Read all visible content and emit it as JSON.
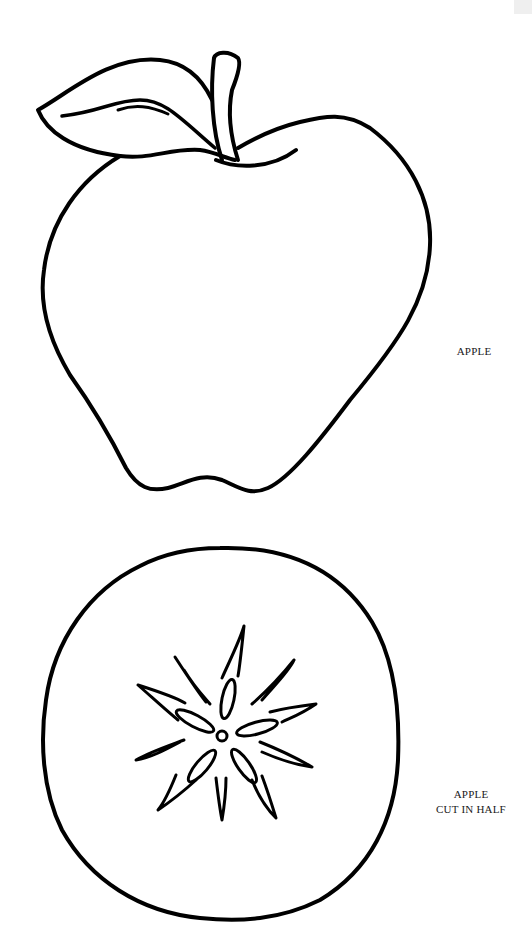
{
  "page": {
    "ink_color": "#000000",
    "paper_color": "#ffffff"
  },
  "figures": [
    {
      "id": "whole-apple",
      "label": "APPLE"
    },
    {
      "id": "apple-cross-section",
      "label_line1": "APPLE",
      "label_line2": "CUT IN HALF"
    }
  ]
}
